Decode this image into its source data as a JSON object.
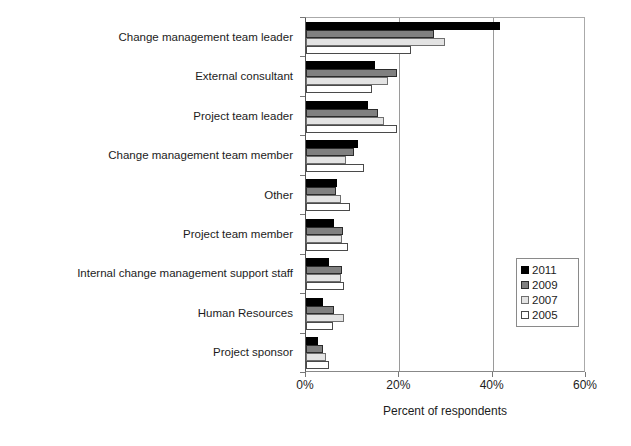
{
  "chart_data": {
    "type": "bar",
    "orientation": "horizontal",
    "title": "",
    "xlabel": "Percent of respondents",
    "ylabel": "",
    "xlim": [
      0,
      60
    ],
    "xunit": "%",
    "xticks": [
      0,
      20,
      40,
      60
    ],
    "xtick_labels": [
      "0%",
      "20%",
      "40%",
      "60%"
    ],
    "grid": "vertical gridlines at 20% and 40%",
    "legend_position": "middle-right inside plot",
    "categories": [
      "Change management team leader",
      "External consultant",
      "Project team leader",
      "Change management team member",
      "Other",
      "Project team member",
      "Internal change management support staff",
      "Human Resources",
      "Project sponsor"
    ],
    "series": [
      {
        "name": "2011",
        "color": "#000000",
        "values": [
          41.5,
          14.8,
          13.3,
          11.2,
          6.7,
          6.0,
          5.0,
          3.6,
          2.6
        ]
      },
      {
        "name": "2009",
        "color": "#808080",
        "values": [
          27.5,
          19.6,
          15.5,
          10.3,
          6.5,
          7.9,
          7.7,
          6.0,
          3.7
        ]
      },
      {
        "name": "2007",
        "color": "#e3e3e3",
        "values": [
          29.7,
          17.6,
          16.8,
          8.6,
          7.5,
          7.7,
          7.5,
          8.2,
          4.3
        ]
      },
      {
        "name": "2005",
        "color": "#ffffff",
        "values": [
          22.6,
          14.2,
          19.4,
          12.4,
          9.5,
          9.0,
          8.1,
          5.7,
          5.0
        ]
      }
    ]
  },
  "legend": {
    "items": [
      {
        "label": "2011",
        "swatch": "black-square-swatch"
      },
      {
        "label": "2009",
        "swatch": "dark-gray-square-swatch"
      },
      {
        "label": "2007",
        "swatch": "light-gray-square-swatch"
      },
      {
        "label": "2005",
        "swatch": "white-square-swatch"
      }
    ]
  }
}
